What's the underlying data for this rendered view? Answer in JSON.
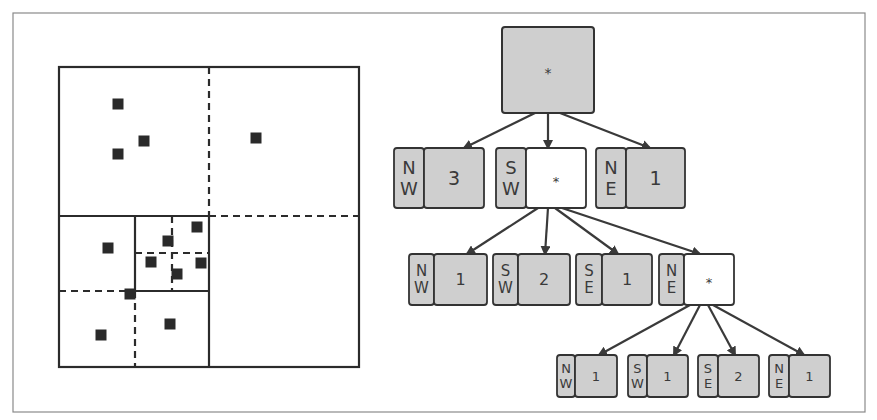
{
  "figure": {
    "frame": {
      "x": 13,
      "y": 13,
      "w": 852,
      "h": 399
    },
    "quadtree_panel": {
      "bounds": {
        "x": 59,
        "y": 67,
        "w": 300,
        "h": 300
      },
      "solid_lines": [
        [
          59,
          216,
          209,
          216
        ],
        [
          209,
          216,
          209,
          367
        ],
        [
          135,
          216,
          135,
          291
        ],
        [
          135,
          291,
          209,
          291
        ]
      ],
      "dashed_lines": [
        [
          209,
          67,
          209,
          216
        ],
        [
          209,
          216,
          359,
          216
        ],
        [
          59,
          291,
          135,
          291
        ],
        [
          135,
          291,
          135,
          367
        ],
        [
          172,
          216,
          172,
          291
        ],
        [
          135,
          253,
          209,
          253
        ]
      ],
      "points": [
        [
          118,
          104
        ],
        [
          144,
          141
        ],
        [
          118,
          154
        ],
        [
          256,
          138
        ],
        [
          108,
          248
        ],
        [
          197,
          227
        ],
        [
          168,
          241
        ],
        [
          151,
          262
        ],
        [
          201,
          263
        ],
        [
          177,
          274
        ],
        [
          130,
          294
        ],
        [
          170,
          324
        ],
        [
          101,
          335
        ]
      ]
    },
    "tree": {
      "root": {
        "x": 502,
        "y": 27,
        "w": 92,
        "h": 86,
        "value": "*"
      },
      "nodes": [
        {
          "id": "l1-nw",
          "label_top": "N",
          "label_bottom": "W",
          "value": "3",
          "internal": false,
          "x": 394,
          "y": 148,
          "lw": 30,
          "vw": 60,
          "h": 60
        },
        {
          "id": "l1-sw",
          "label_top": "S",
          "label_bottom": "W",
          "value": "*",
          "internal": true,
          "x": 496,
          "y": 148,
          "lw": 30,
          "vw": 60,
          "h": 60
        },
        {
          "id": "l1-ne",
          "label_top": "N",
          "label_bottom": "E",
          "value": "1",
          "internal": false,
          "x": 596,
          "y": 148,
          "lw": 30,
          "vw": 59,
          "h": 60
        },
        {
          "id": "l2-nw",
          "label_top": "N",
          "label_bottom": "W",
          "value": "1",
          "internal": false,
          "x": 409,
          "y": 254,
          "lw": 25,
          "vw": 53,
          "h": 51
        },
        {
          "id": "l2-sw",
          "label_top": "S",
          "label_bottom": "W",
          "value": "2",
          "internal": false,
          "x": 493,
          "y": 254,
          "lw": 25,
          "vw": 52,
          "h": 51
        },
        {
          "id": "l2-se",
          "label_top": "S",
          "label_bottom": "E",
          "value": "1",
          "internal": false,
          "x": 576,
          "y": 254,
          "lw": 26,
          "vw": 50,
          "h": 51
        },
        {
          "id": "l2-ne",
          "label_top": "N",
          "label_bottom": "E",
          "value": "*",
          "internal": true,
          "x": 659,
          "y": 254,
          "lw": 25,
          "vw": 50,
          "h": 51
        },
        {
          "id": "l3-nw",
          "label_top": "N",
          "label_bottom": "W",
          "value": "1",
          "internal": false,
          "x": 557,
          "y": 355,
          "lw": 18,
          "vw": 42,
          "h": 42
        },
        {
          "id": "l3-sw",
          "label_top": "S",
          "label_bottom": "W",
          "value": "1",
          "internal": false,
          "x": 628,
          "y": 355,
          "lw": 19,
          "vw": 41,
          "h": 42
        },
        {
          "id": "l3-se",
          "label_top": "S",
          "label_bottom": "E",
          "value": "2",
          "internal": false,
          "x": 698,
          "y": 355,
          "lw": 20,
          "vw": 41,
          "h": 42
        },
        {
          "id": "l3-ne",
          "label_top": "N",
          "label_bottom": "E",
          "value": "1",
          "internal": false,
          "x": 769,
          "y": 355,
          "lw": 20,
          "vw": 41,
          "h": 42
        }
      ],
      "edges": [
        [
          535,
          113,
          464,
          148
        ],
        [
          548,
          113,
          548,
          148
        ],
        [
          560,
          113,
          650,
          148
        ],
        [
          538,
          208,
          467,
          254
        ],
        [
          548,
          208,
          545,
          254
        ],
        [
          555,
          208,
          618,
          254
        ],
        [
          562,
          208,
          700,
          254
        ],
        [
          690,
          305,
          599,
          355
        ],
        [
          700,
          305,
          674,
          355
        ],
        [
          708,
          305,
          735,
          355
        ],
        [
          713,
          305,
          804,
          355
        ]
      ]
    }
  }
}
